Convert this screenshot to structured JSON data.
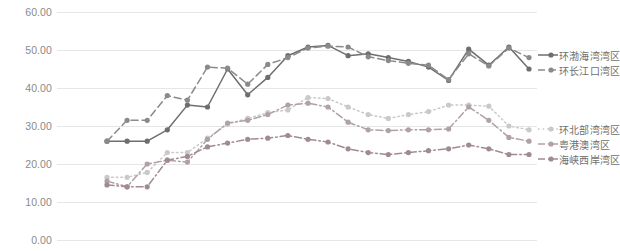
{
  "chart_data": {
    "type": "line",
    "title": "",
    "xlabel": "",
    "ylabel": "",
    "ylim": [
      0,
      60
    ],
    "yticks": [
      0,
      10,
      20,
      30,
      40,
      50,
      60
    ],
    "ytick_labels": [
      "0.00",
      "10.00",
      "20.00",
      "30.00",
      "40.00",
      "50.00",
      "60.00"
    ],
    "grid": true,
    "legend_position": "right",
    "x": [
      1,
      2,
      3,
      4,
      5,
      6,
      7,
      8,
      9,
      10,
      11,
      12,
      13,
      14,
      15,
      16,
      17,
      18,
      19,
      20,
      21,
      22
    ],
    "series": [
      {
        "name": "环渤海湾湾区",
        "color": "#6e6e6e",
        "style": "solid",
        "marker": "circle",
        "values": [
          26.0,
          26.0,
          26.0,
          29.0,
          35.5,
          35.0,
          45.0,
          38.2,
          42.8,
          48.5,
          50.8,
          51.2,
          48.5,
          49.0,
          48.0,
          47.0,
          45.5,
          42.0,
          50.2,
          46.0,
          50.8,
          45.0
        ]
      },
      {
        "name": "环长江口湾区",
        "color": "#8a8a8a",
        "style": "dashed",
        "marker": "circle",
        "values": [
          26.0,
          31.5,
          31.5,
          38.0,
          36.8,
          45.5,
          45.2,
          41.0,
          46.2,
          48.0,
          50.5,
          51.0,
          50.8,
          48.2,
          47.2,
          46.5,
          46.0,
          42.2,
          49.0,
          45.8,
          50.5,
          48.0
        ]
      },
      {
        "name": "环北部湾湾区",
        "color": "#c9c9c9",
        "style": "dotted",
        "marker": "circle",
        "values": [
          16.5,
          16.5,
          17.8,
          23.0,
          23.0,
          26.8,
          30.5,
          32.0,
          33.5,
          34.2,
          37.5,
          37.2,
          35.0,
          33.0,
          32.0,
          33.0,
          33.8,
          35.5,
          35.5,
          35.2,
          30.0,
          29.0
        ]
      },
      {
        "name": "粤港澳湾区",
        "color": "#b0a0a8",
        "style": "dashdot",
        "marker": "circle",
        "values": [
          15.5,
          14.0,
          20.0,
          21.0,
          20.5,
          26.5,
          30.8,
          31.5,
          33.0,
          35.5,
          36.0,
          35.0,
          31.0,
          29.0,
          28.8,
          29.0,
          29.0,
          29.2,
          35.0,
          31.5,
          27.0,
          26.0
        ]
      },
      {
        "name": "海峡西岸湾区",
        "color": "#a08a96",
        "style": "dashdot",
        "marker": "circle",
        "values": [
          14.5,
          14.0,
          14.0,
          21.0,
          22.0,
          24.5,
          25.5,
          26.5,
          26.8,
          27.5,
          26.5,
          25.8,
          24.0,
          23.0,
          22.5,
          23.0,
          23.5,
          24.0,
          25.0,
          24.0,
          22.5,
          22.5
        ]
      }
    ]
  },
  "legend": {
    "groups": [
      {
        "items": [
          "环渤海湾湾区",
          "环长江口湾区"
        ]
      },
      {
        "items": [
          "环北部湾湾区",
          "粤港澳湾区",
          "海峡西岸湾区"
        ]
      }
    ]
  }
}
